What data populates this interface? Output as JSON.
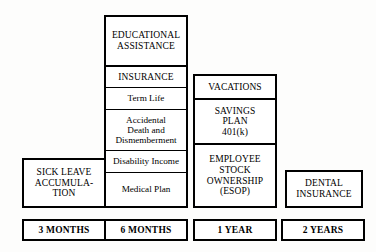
{
  "diagram": {
    "type": "staircase-block-diagram",
    "columns": [
      {
        "id": "col-3-months",
        "tenure_label": "3 MONTHS",
        "blocks": [
          {
            "id": "sick-leave",
            "label": "SICK LEAVE\nACCUMULA-\nTION",
            "style": "caps"
          }
        ]
      },
      {
        "id": "col-6-months",
        "tenure_label": "6 MONTHS",
        "blocks": [
          {
            "id": "educational-assistance",
            "label": "EDUCATIONAL\nASSISTANCE",
            "style": "caps"
          },
          {
            "id": "insurance",
            "label": "INSURANCE",
            "style": "caps"
          },
          {
            "id": "term-life",
            "label": "Term Life",
            "style": "mixed"
          },
          {
            "id": "accidental-death-dismemberment",
            "label": "Accidental\nDeath and\nDismemberment",
            "style": "mixed"
          },
          {
            "id": "disability-income",
            "label": "Disability Income",
            "style": "mixed"
          },
          {
            "id": "medical-plan",
            "label": "Medical Plan",
            "style": "mixed"
          }
        ]
      },
      {
        "id": "col-1-year",
        "tenure_label": "1 YEAR",
        "blocks": [
          {
            "id": "vacations",
            "label": "VACATIONS",
            "style": "caps"
          },
          {
            "id": "savings-plan",
            "label": "SAVINGS\nPLAN\n401(k)",
            "style": "caps"
          },
          {
            "id": "esop",
            "label": "EMPLOYEE\nSTOCK\nOWNERSHIP\n(ESOP)",
            "style": "caps"
          }
        ]
      },
      {
        "id": "col-2-years",
        "tenure_label": "2 YEARS",
        "blocks": [
          {
            "id": "dental-insurance",
            "label": "DENTAL\nINSURANCE",
            "style": "caps"
          }
        ]
      }
    ],
    "colors": {
      "background": "#fdfdfc",
      "box_fill": "#ffffff",
      "border": "#000000",
      "text": "#000000"
    }
  }
}
